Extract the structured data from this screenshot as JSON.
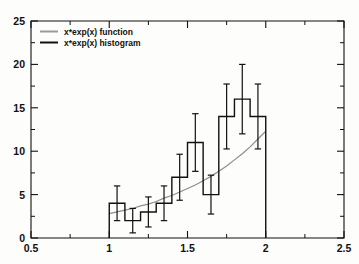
{
  "chart_data": {
    "type": "bar",
    "title": "",
    "subtitle": "",
    "xlabel": "",
    "ylabel": "",
    "xlim": [
      0.5,
      2.5
    ],
    "ylim": [
      0,
      25
    ],
    "grid": false,
    "legend_position": "top-left",
    "x_ticks": [
      "0.5",
      "1",
      "1.5",
      "2",
      "2.5"
    ],
    "x_tick_values": [
      0.5,
      1.0,
      1.5,
      2.0,
      2.5
    ],
    "x_minor_ticks": [
      0.75,
      1.25,
      1.75,
      2.25
    ],
    "y_ticks": [
      "0",
      "5",
      "10",
      "15",
      "20",
      "25"
    ],
    "y_tick_values": [
      0,
      5,
      10,
      15,
      20,
      25
    ],
    "y_minor_ticks": [
      2.5,
      7.5,
      12.5,
      17.5,
      22.5
    ],
    "bin_width": 0.1,
    "bin_edges": [
      1.0,
      1.1,
      1.2,
      1.3,
      1.4,
      1.5,
      1.6,
      1.7,
      1.8,
      1.9,
      2.0
    ],
    "bin_centers": [
      1.05,
      1.15,
      1.25,
      1.35,
      1.45,
      1.55,
      1.65,
      1.75,
      1.85,
      1.95
    ],
    "categories": [
      "1.05",
      "1.15",
      "1.25",
      "1.35",
      "1.45",
      "1.55",
      "1.65",
      "1.75",
      "1.85",
      "1.95"
    ],
    "values": [
      4,
      2,
      3,
      4,
      7,
      11,
      5,
      14,
      16,
      14
    ],
    "errors": [
      2.0,
      1.41,
      1.73,
      2.0,
      2.65,
      3.32,
      2.24,
      3.74,
      4.0,
      3.74
    ],
    "series": [
      {
        "name": "x*exp(x) histogram",
        "type": "bar",
        "values": [
          4,
          2,
          3,
          4,
          7,
          11,
          5,
          14,
          16,
          14
        ],
        "errors": [
          2.0,
          1.41,
          1.73,
          2.0,
          2.65,
          3.32,
          2.24,
          3.74,
          4.0,
          3.74
        ],
        "color": "#111111"
      },
      {
        "name": "x*exp(x) function",
        "type": "line",
        "x": [
          1.0,
          1.05,
          1.1,
          1.15,
          1.2,
          1.25,
          1.3,
          1.35,
          1.4,
          1.45,
          1.5,
          1.55,
          1.6,
          1.65,
          1.7,
          1.75,
          1.8,
          1.85,
          1.9,
          1.95,
          2.0
        ],
        "y": [
          2.8,
          3.0,
          3.2,
          3.4,
          3.7,
          3.9,
          4.2,
          4.6,
          4.9,
          5.3,
          5.7,
          6.1,
          6.6,
          7.1,
          7.7,
          8.3,
          9.0,
          9.7,
          10.5,
          11.4,
          12.3
        ],
        "color": "#8e8e8e"
      }
    ],
    "annotations": []
  },
  "legend": {
    "entries": [
      {
        "label": "x*exp(x) function",
        "color": "#9a9a9a",
        "style": "line"
      },
      {
        "label": "x*exp(x) histogram",
        "color": "#111111",
        "style": "line"
      }
    ]
  },
  "axes": {
    "x_tick_labels": [
      "0.5",
      "1",
      "1.5",
      "2",
      "2.5"
    ],
    "y_tick_labels": [
      "0",
      "5",
      "10",
      "15",
      "20",
      "25"
    ]
  }
}
